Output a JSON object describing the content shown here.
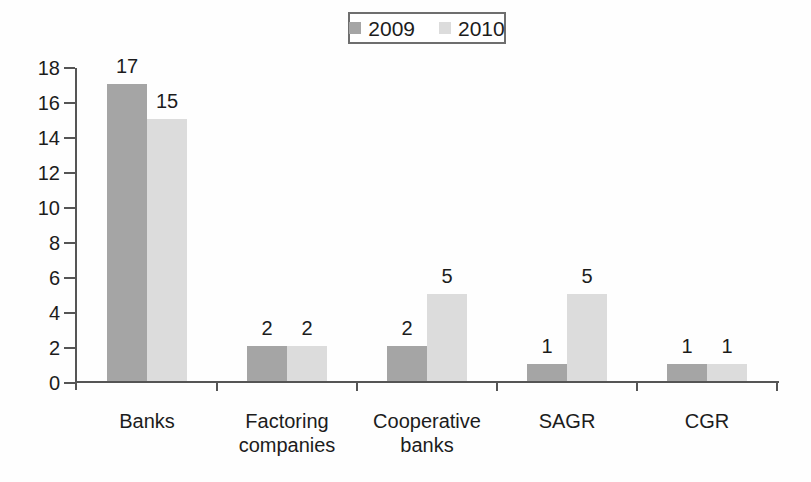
{
  "chart_data": {
    "type": "bar",
    "title": "",
    "xlabel": "",
    "ylabel": "",
    "categories": [
      "Banks",
      "Factoring\ncompanies",
      "Cooperative\nbanks",
      "SAGR",
      "CGR"
    ],
    "series": [
      {
        "name": "2009",
        "color": "#a5a5a5",
        "values": [
          17,
          2,
          2,
          1,
          1
        ]
      },
      {
        "name": "2010",
        "color": "#dcdcdc",
        "values": [
          15,
          2,
          5,
          5,
          1
        ]
      }
    ],
    "y_ticks": [
      0,
      2,
      4,
      6,
      8,
      10,
      12,
      14,
      16,
      18
    ],
    "ylim": [
      0,
      18
    ],
    "grid": false,
    "bar_value_labels": true,
    "legend_position": "top-center",
    "legend_border": true,
    "colors": {
      "axis": "#555555",
      "text": "#1c1c1c",
      "background": "#fefefe",
      "legend_border": "#6e6e6e"
    }
  }
}
